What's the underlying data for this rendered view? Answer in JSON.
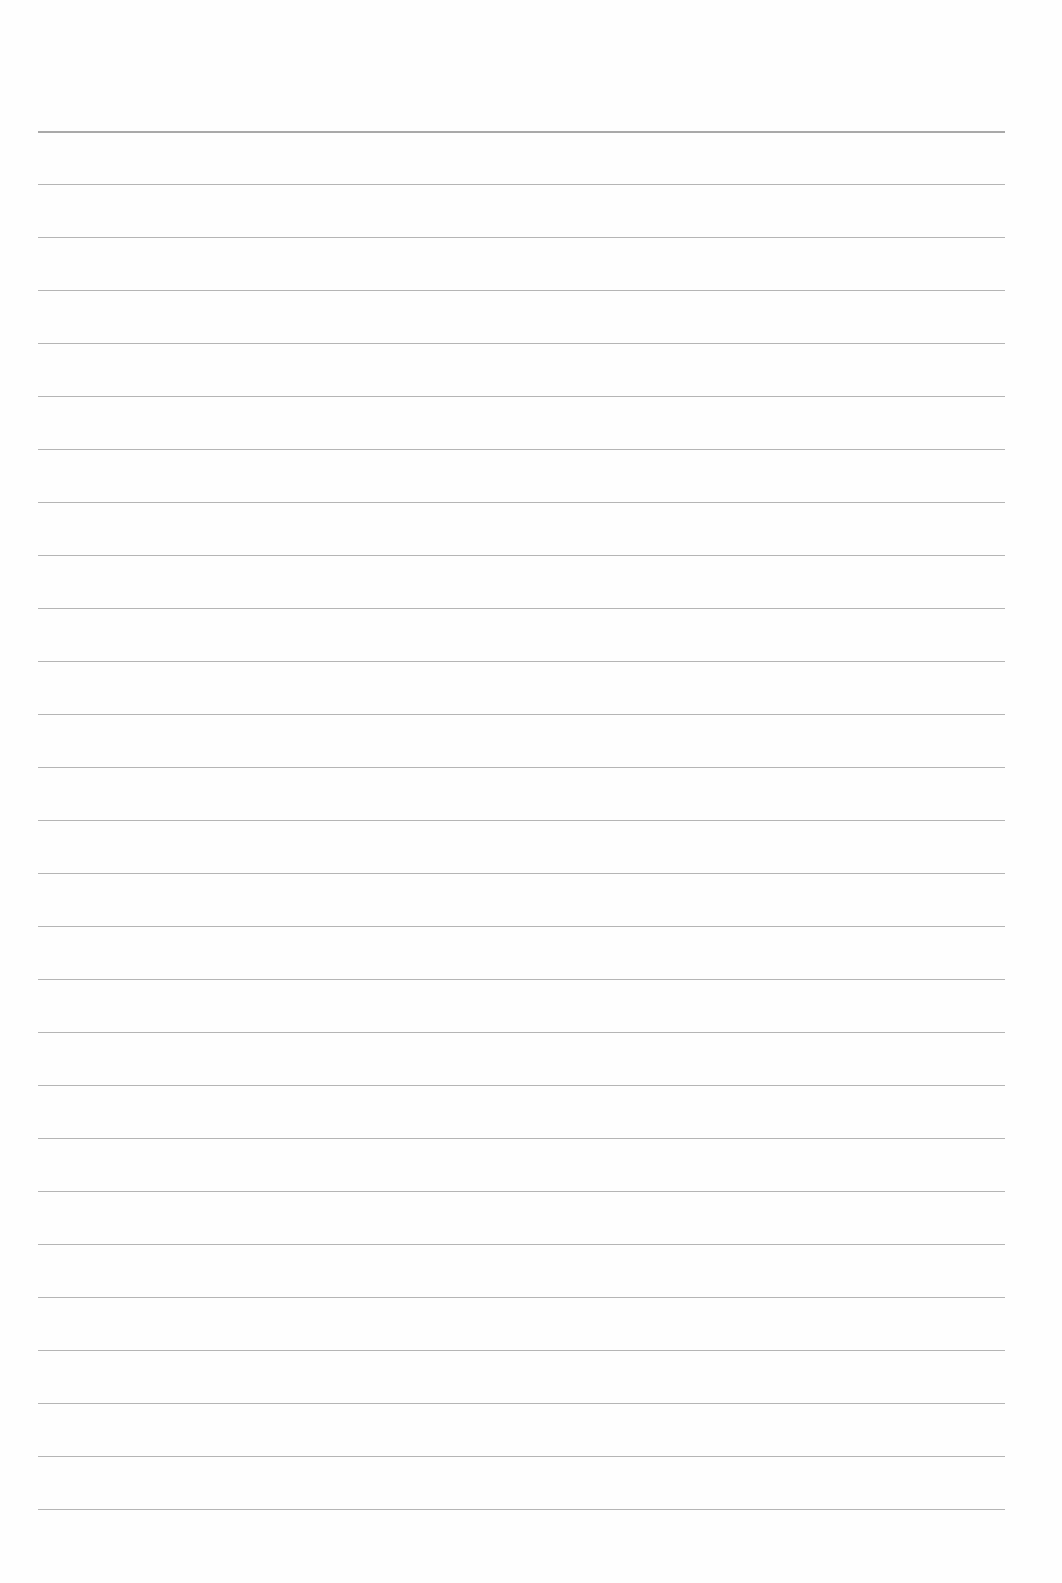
{
  "page": {
    "type": "lined-paper",
    "background_color": "#fefefe",
    "line_color": "#a8a8a8",
    "line_count": 27,
    "first_line_y": 131,
    "line_spacing": 53,
    "line_left": 38,
    "line_right": 1005,
    "text": ""
  }
}
